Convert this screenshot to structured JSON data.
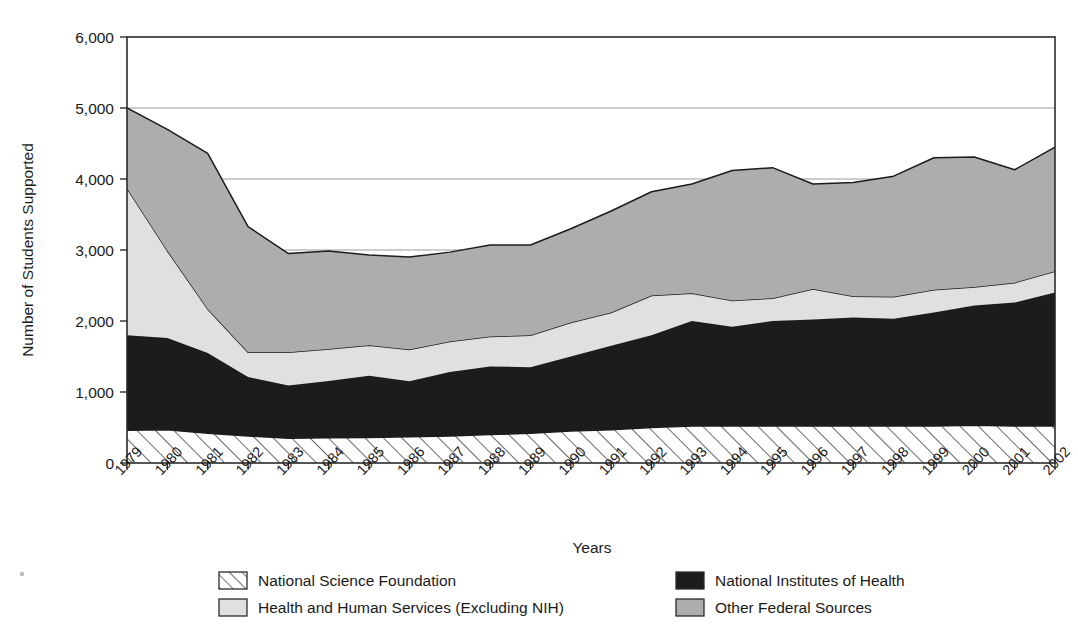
{
  "chart_data": {
    "type": "area",
    "stacked": true,
    "title": "",
    "xlabel": "Years",
    "ylabel": "Number of Students Supported",
    "ylim": [
      0,
      6000
    ],
    "ytick_labels": [
      "0",
      "1,000",
      "2,000",
      "3,000",
      "4,000",
      "5,000",
      "6,000"
    ],
    "ytick_values": [
      0,
      1000,
      2000,
      3000,
      4000,
      5000,
      6000
    ],
    "grid": "horizontal-major-partial",
    "legend_position": "below-plot",
    "categories": [
      "1979",
      "1980",
      "1981",
      "1982",
      "1983",
      "1984",
      "1985",
      "1986",
      "1987",
      "1988",
      "1989",
      "1990",
      "1991",
      "1992",
      "1993",
      "1994",
      "1995",
      "1996",
      "1997",
      "1998",
      "1999",
      "2000",
      "2001",
      "2002"
    ],
    "series": [
      {
        "name": "National Science Foundation",
        "fill_style": "diagonal-hatch",
        "color": "#ffffff",
        "values": [
          460,
          470,
          420,
          380,
          350,
          355,
          360,
          370,
          380,
          400,
          420,
          450,
          470,
          500,
          520,
          520,
          520,
          520,
          520,
          520,
          520,
          530,
          520,
          520
        ]
      },
      {
        "name": "National Institutes of Health",
        "fill_style": "solid",
        "color": "#1c1c1c",
        "values": [
          1340,
          1290,
          1130,
          830,
          740,
          800,
          870,
          780,
          900,
          960,
          930,
          1050,
          1180,
          1300,
          1480,
          1400,
          1480,
          1500,
          1530,
          1510,
          1600,
          1690,
          1740,
          1880
        ]
      },
      {
        "name": "Health and Human Services (Excluding NIH)",
        "fill_style": "solid",
        "color": "#e0e0e0",
        "values": [
          2070,
          1230,
          620,
          350,
          470,
          450,
          430,
          450,
          430,
          420,
          450,
          480,
          470,
          560,
          390,
          370,
          320,
          430,
          300,
          310,
          320,
          260,
          280,
          300
        ]
      },
      {
        "name": "Other Federal Sources",
        "fill_style": "solid",
        "color": "#adadad",
        "values": [
          1130,
          1710,
          2190,
          1770,
          1390,
          1380,
          1270,
          1300,
          1260,
          1290,
          1270,
          1320,
          1430,
          1460,
          1540,
          1830,
          1840,
          1480,
          1600,
          1700,
          1860,
          1830,
          1590,
          1750
        ]
      }
    ],
    "totals": [
      5000,
      4700,
      4360,
      3330,
      2950,
      2985,
      2930,
      2900,
      2970,
      3070,
      3070,
      3300,
      3550,
      3820,
      3930,
      4120,
      4160,
      3930,
      3950,
      4040,
      4300,
      4310,
      4130,
      4450
    ]
  },
  "legend": {
    "items": [
      {
        "label": "National Science Foundation",
        "swatch": "hatch-swatch"
      },
      {
        "label": "National Institutes of Health",
        "swatch": "black-swatch"
      },
      {
        "label": "Health and Human Services (Excluding NIH)",
        "swatch": "light-gray-swatch"
      },
      {
        "label": "Other Federal Sources",
        "swatch": "mid-gray-swatch"
      }
    ]
  },
  "colors": {
    "nsf": "#ffffff",
    "nih": "#1c1c1c",
    "hhs": "#e0e0e0",
    "other": "#adadad",
    "outline": "#1c1c1c",
    "grid": "#9a9a9a",
    "axis": "#2b2b2b",
    "text": "#1a1a1a"
  }
}
